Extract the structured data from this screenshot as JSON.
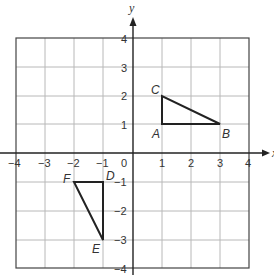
{
  "diagram": {
    "type": "coordinate-plane",
    "x_axis_label": "x",
    "y_axis_label": "y",
    "x_range": [
      -4,
      4
    ],
    "y_range": [
      -4,
      4
    ],
    "x_ticks": [
      "−4",
      "−3",
      "−2",
      "−1",
      "0",
      "1",
      "2",
      "3",
      "4"
    ],
    "y_ticks": [
      "4",
      "3",
      "2",
      "1",
      "−1",
      "−2",
      "−3",
      "−4"
    ],
    "triangles": [
      {
        "name": "ABC",
        "vertices": [
          {
            "label": "A",
            "x": 1,
            "y": 1
          },
          {
            "label": "B",
            "x": 3,
            "y": 1
          },
          {
            "label": "C",
            "x": 1,
            "y": 2
          }
        ]
      },
      {
        "name": "DEF",
        "vertices": [
          {
            "label": "D",
            "x": -1,
            "y": -1
          },
          {
            "label": "E",
            "x": -1,
            "y": -3
          },
          {
            "label": "F",
            "x": -2,
            "y": -1
          }
        ]
      }
    ]
  }
}
